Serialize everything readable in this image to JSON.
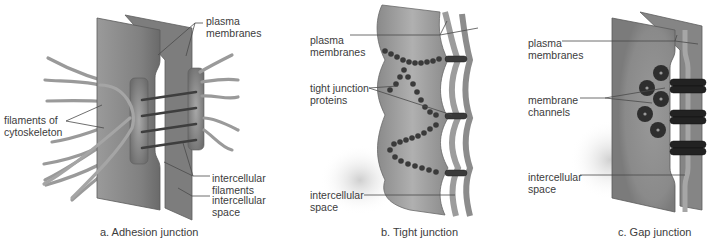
{
  "figure": {
    "panels": [
      {
        "id": "a",
        "caption": "a. Adhesion junction",
        "labels": {
          "plasma_membranes_1": "plasma",
          "plasma_membranes_2": "membranes",
          "filaments_1": "filaments of",
          "filaments_2": "cytoskeleton",
          "intercellular_filaments_1": "intercellular",
          "intercellular_filaments_2": "filaments",
          "intercellular_space_1": "intercellular",
          "intercellular_space_2": "space"
        }
      },
      {
        "id": "b",
        "caption": "b. Tight junction",
        "labels": {
          "plasma_membranes_1": "plasma",
          "plasma_membranes_2": "membranes",
          "tight_junction_proteins_1": "tight junction",
          "tight_junction_proteins_2": "proteins",
          "intercellular_space_1": "intercellular",
          "intercellular_space_2": "space"
        }
      },
      {
        "id": "c",
        "caption": "c. Gap junction",
        "labels": {
          "plasma_membranes_1": "plasma",
          "plasma_membranes_2": "membranes",
          "membrane_channels_1": "membrane",
          "membrane_channels_2": "channels",
          "intercellular_space_1": "intercellular",
          "intercellular_space_2": "space"
        }
      }
    ],
    "colors": {
      "membrane": "#8c8c8c",
      "membrane_light": "#b5b5b5",
      "membrane_dark": "#5e5e5e",
      "filament": "#9a9a9a",
      "protein": "#3a3a3a",
      "leader_line": "#4a4a4a",
      "text": "#3c3c3c"
    }
  }
}
